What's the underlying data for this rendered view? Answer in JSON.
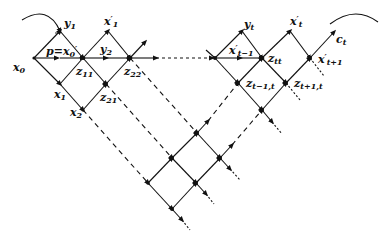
{
  "diagram": {
    "type": "lattice-flow-diagram",
    "labels": {
      "x0": {
        "base": "x",
        "sub": "0",
        "sup": ""
      },
      "y1": {
        "base": "y",
        "sub": "1",
        "sup": ""
      },
      "p_eq": {
        "base": "p=x",
        "sub": "0",
        "sup": "′"
      },
      "x1p": {
        "base": "x",
        "sub": "1",
        "sup": "′"
      },
      "y2": {
        "base": "y",
        "sub": "2",
        "sup": ""
      },
      "z11": {
        "base": "z",
        "sub": "11",
        "sup": ""
      },
      "z22": {
        "base": "z",
        "sub": "22",
        "sup": ""
      },
      "x1": {
        "base": "x",
        "sub": "1",
        "sup": ""
      },
      "z21": {
        "base": "z",
        "sub": "21",
        "sup": ""
      },
      "x2": {
        "base": "x",
        "sub": "2",
        "sup": ""
      },
      "yt": {
        "base": "y",
        "sub": "t",
        "sup": ""
      },
      "xtm1p": {
        "base": "x",
        "sub": "t−1",
        "sup": "′"
      },
      "ztt": {
        "base": "z",
        "sub": "tt",
        "sup": ""
      },
      "ztm1t": {
        "base": "z",
        "sub": "t−1,t",
        "sup": ""
      },
      "xtp": {
        "base": "x",
        "sub": "t",
        "sup": "′"
      },
      "xtp1p": {
        "base": "x",
        "sub": "t+1",
        "sup": "′"
      },
      "ztp1t": {
        "base": "z",
        "sub": "t+1,t",
        "sup": ""
      },
      "ct": {
        "base": "c",
        "sub": "t",
        "sup": ""
      }
    },
    "colors": {
      "ink": "#111111",
      "background": "#ffffff"
    }
  }
}
